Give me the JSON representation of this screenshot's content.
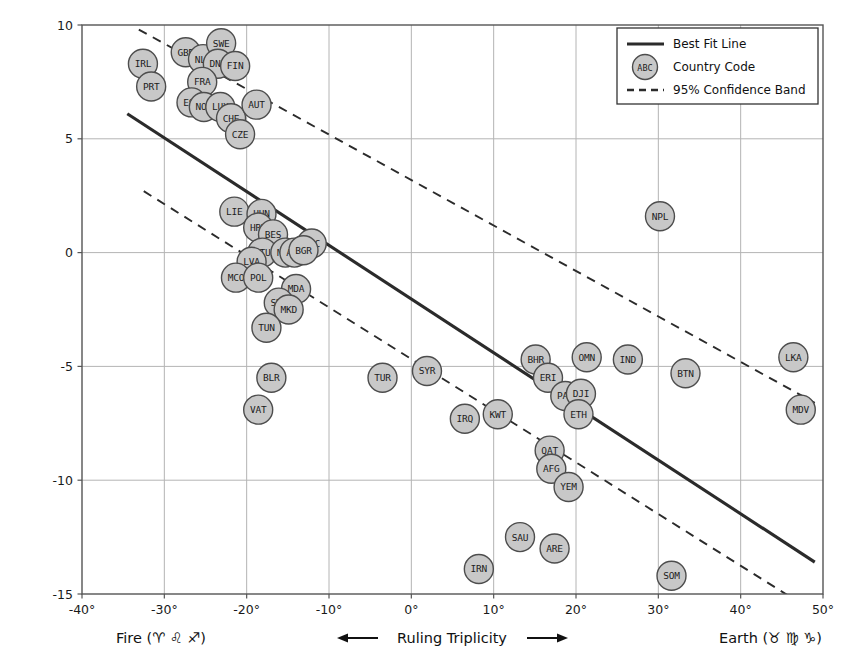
{
  "chart_data": {
    "type": "scatter",
    "title": "",
    "xlabel": "",
    "ylabel": "Spartacus Gay Travel Index Score for the Year 2017",
    "xlim": [
      -40,
      50
    ],
    "ylim": [
      -15,
      10
    ],
    "xticks": [
      "-40°",
      "-30°",
      "-20°",
      "-10°",
      "0°",
      "10°",
      "20°",
      "30°",
      "40°",
      "50°"
    ],
    "xtick_values": [
      -40,
      -30,
      -20,
      -10,
      0,
      10,
      20,
      30,
      40,
      50
    ],
    "yticks": [
      "10",
      "5",
      "0",
      "-5",
      "-10",
      "-15"
    ],
    "ytick_values": [
      10,
      5,
      0,
      -5,
      -10,
      -15
    ],
    "grid": true,
    "legend_position": "upper right",
    "marker_fill": "#c8c8c8",
    "marker_stroke": "#4d4d4d",
    "line_color": "#2b2b2b",
    "grid_color": "#b4b4b4",
    "points": [
      {
        "code": "IRL",
        "x": -32.6,
        "y": 8.3
      },
      {
        "code": "PRT",
        "x": -31.6,
        "y": 7.3
      },
      {
        "code": "GBR",
        "x": -27.4,
        "y": 8.8
      },
      {
        "code": "NLD",
        "x": -25.3,
        "y": 8.5
      },
      {
        "code": "SWE",
        "x": -23.1,
        "y": 9.2
      },
      {
        "code": "DNK",
        "x": -23.5,
        "y": 8.3
      },
      {
        "code": "FIN",
        "x": -21.4,
        "y": 8.2
      },
      {
        "code": "FRA",
        "x": -25.4,
        "y": 7.5
      },
      {
        "code": "ESP",
        "x": -26.7,
        "y": 6.6
      },
      {
        "code": "NOR",
        "x": -25.2,
        "y": 6.4
      },
      {
        "code": "LUX",
        "x": -23.2,
        "y": 6.4
      },
      {
        "code": "CHE",
        "x": -21.9,
        "y": 5.9
      },
      {
        "code": "AUT",
        "x": -18.8,
        "y": 6.5
      },
      {
        "code": "CZE",
        "x": -20.8,
        "y": 5.2
      },
      {
        "code": "LIE",
        "x": -21.5,
        "y": 1.8
      },
      {
        "code": "HUN",
        "x": -18.2,
        "y": 1.7
      },
      {
        "code": "HRV",
        "x": -18.6,
        "y": 1.1
      },
      {
        "code": "BES",
        "x": -16.8,
        "y": 0.8
      },
      {
        "code": "GRC",
        "x": -12.1,
        "y": 0.4
      },
      {
        "code": "LTU",
        "x": -18.1,
        "y": 0.0
      },
      {
        "code": "MNE",
        "x": -15.3,
        "y": 0.0
      },
      {
        "code": "ALB",
        "x": -14.2,
        "y": 0.0
      },
      {
        "code": "BGR",
        "x": -13.1,
        "y": 0.1
      },
      {
        "code": "LVA",
        "x": -19.4,
        "y": -0.4
      },
      {
        "code": "MCO",
        "x": -21.3,
        "y": -1.1
      },
      {
        "code": "POL",
        "x": -18.6,
        "y": -1.1
      },
      {
        "code": "MDA",
        "x": -14.0,
        "y": -1.6
      },
      {
        "code": "SRB",
        "x": -16.1,
        "y": -2.2
      },
      {
        "code": "MKD",
        "x": -14.9,
        "y": -2.5
      },
      {
        "code": "TUN",
        "x": -17.6,
        "y": -3.3
      },
      {
        "code": "BLR",
        "x": -17.0,
        "y": -5.5
      },
      {
        "code": "VAT",
        "x": -18.6,
        "y": -6.9
      },
      {
        "code": "TUR",
        "x": -3.5,
        "y": -5.5
      },
      {
        "code": "SYR",
        "x": 1.9,
        "y": -5.2
      },
      {
        "code": "IRQ",
        "x": 6.5,
        "y": -7.3
      },
      {
        "code": "KWT",
        "x": 10.5,
        "y": -7.1
      },
      {
        "code": "BHR",
        "x": 15.1,
        "y": -4.7
      },
      {
        "code": "ERI",
        "x": 16.6,
        "y": -5.5
      },
      {
        "code": "PAK",
        "x": 18.7,
        "y": -6.3
      },
      {
        "code": "OMN",
        "x": 21.3,
        "y": -4.6
      },
      {
        "code": "DJI",
        "x": 20.6,
        "y": -6.2
      },
      {
        "code": "ETH",
        "x": 20.3,
        "y": -7.1
      },
      {
        "code": "IND",
        "x": 26.3,
        "y": -4.7
      },
      {
        "code": "NPL",
        "x": 30.2,
        "y": 1.6
      },
      {
        "code": "BTN",
        "x": 33.3,
        "y": -5.3
      },
      {
        "code": "LKA",
        "x": 46.4,
        "y": -4.6
      },
      {
        "code": "MDV",
        "x": 47.3,
        "y": -6.9
      },
      {
        "code": "QAT",
        "x": 16.8,
        "y": -8.7
      },
      {
        "code": "AFG",
        "x": 17.0,
        "y": -9.5
      },
      {
        "code": "YEM",
        "x": 19.1,
        "y": -10.3
      },
      {
        "code": "SAU",
        "x": 13.2,
        "y": -12.5
      },
      {
        "code": "ARE",
        "x": 17.4,
        "y": -13.0
      },
      {
        "code": "IRN",
        "x": 8.2,
        "y": -13.9
      },
      {
        "code": "SOM",
        "x": 31.6,
        "y": -14.2
      }
    ],
    "best_fit_line": {
      "x1": -34.5,
      "y1": 6.1,
      "x2": 49.0,
      "y2": -13.6
    },
    "confidence_band_upper": {
      "x1": -33.1,
      "y1": 9.8,
      "x2": 49.0,
      "y2": -6.6
    },
    "confidence_band_lower": {
      "x1": -32.5,
      "y1": 2.7,
      "x2": 49.0,
      "y2": -15.8
    }
  },
  "legend": {
    "items": [
      {
        "label": "Best Fit Line",
        "type": "line"
      },
      {
        "label": "Country Code",
        "type": "marker",
        "marker_text": "ABC"
      },
      {
        "label": "95% Confidence Band",
        "type": "dashed"
      }
    ]
  },
  "footer": {
    "left": "Fire (♈ ♌ ♐)",
    "center": "Ruling Triplicity",
    "right": "Earth (♉ ♍ ♑)"
  }
}
